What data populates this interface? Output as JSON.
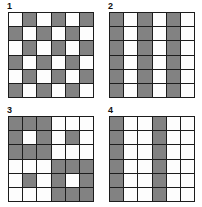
{
  "figure": {
    "colors": {
      "shaded": "#828282",
      "empty": "#fdfdfd",
      "gridline": "#1c1c1c",
      "background": "#ffffff"
    },
    "grid_size": {
      "rows": 6,
      "cols": 6
    }
  },
  "panels": [
    {
      "label": "1",
      "name": "checkerboard-pattern",
      "rows": [
        [
          "w",
          "g",
          "w",
          "g",
          "w",
          "g"
        ],
        [
          "g",
          "w",
          "g",
          "w",
          "g",
          "w"
        ],
        [
          "w",
          "g",
          "w",
          "g",
          "w",
          "g"
        ],
        [
          "g",
          "w",
          "g",
          "w",
          "g",
          "w"
        ],
        [
          "w",
          "g",
          "w",
          "g",
          "w",
          "g"
        ],
        [
          "g",
          "w",
          "g",
          "w",
          "g",
          "w"
        ]
      ]
    },
    {
      "label": "2",
      "name": "vertical-stripes-pattern",
      "rows": [
        [
          "g",
          "w",
          "g",
          "w",
          "g",
          "w"
        ],
        [
          "g",
          "w",
          "g",
          "w",
          "g",
          "w"
        ],
        [
          "g",
          "w",
          "g",
          "w",
          "g",
          "w"
        ],
        [
          "g",
          "w",
          "g",
          "w",
          "g",
          "w"
        ],
        [
          "g",
          "w",
          "g",
          "w",
          "g",
          "w"
        ],
        [
          "g",
          "w",
          "g",
          "w",
          "g",
          "w"
        ]
      ]
    },
    {
      "label": "3",
      "name": "quadrant-blocks-pattern",
      "rows": [
        [
          "g",
          "g",
          "g",
          "w",
          "w",
          "w"
        ],
        [
          "g",
          "w",
          "g",
          "w",
          "g",
          "w"
        ],
        [
          "g",
          "g",
          "g",
          "w",
          "w",
          "w"
        ],
        [
          "w",
          "w",
          "w",
          "g",
          "g",
          "g"
        ],
        [
          "w",
          "g",
          "w",
          "g",
          "w",
          "g"
        ],
        [
          "w",
          "w",
          "w",
          "g",
          "g",
          "g"
        ]
      ]
    },
    {
      "label": "4",
      "name": "triple-period-stripes-pattern",
      "rows": [
        [
          "g",
          "w",
          "w",
          "g",
          "w",
          "w"
        ],
        [
          "g",
          "w",
          "w",
          "g",
          "w",
          "w"
        ],
        [
          "g",
          "w",
          "w",
          "g",
          "w",
          "w"
        ],
        [
          "g",
          "w",
          "w",
          "g",
          "w",
          "w"
        ],
        [
          "g",
          "w",
          "w",
          "g",
          "w",
          "w"
        ],
        [
          "g",
          "w",
          "w",
          "g",
          "w",
          "w"
        ]
      ]
    }
  ]
}
